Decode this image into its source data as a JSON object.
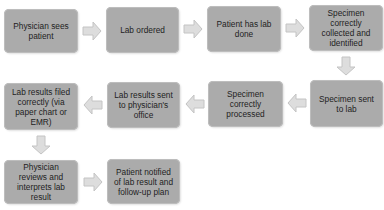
{
  "diagram": {
    "type": "flowchart",
    "title": "",
    "colors": {
      "box_fill": "#ababab",
      "arrow_fill": "#dddddd",
      "arrow_stroke": "#c4c4c4",
      "text": "#1e1e1e"
    },
    "steps": [
      {
        "id": 1,
        "label": "Physician sees patient"
      },
      {
        "id": 2,
        "label": "Lab ordered"
      },
      {
        "id": 3,
        "label": "Patient has lab done"
      },
      {
        "id": 4,
        "label": "Specimen correctly collected and identified"
      },
      {
        "id": 5,
        "label": "Specimen sent to lab"
      },
      {
        "id": 6,
        "label": "Specimen correctly processed"
      },
      {
        "id": 7,
        "label": "Lab results sent to physician's office"
      },
      {
        "id": 8,
        "label": "Lab results filed correctly (via paper chart or EMR)"
      },
      {
        "id": 9,
        "label": "Physician reviews and interprets lab result"
      },
      {
        "id": 10,
        "label": "Patient notified of lab result and follow-up plan"
      }
    ],
    "edges": [
      {
        "from": 1,
        "to": 2,
        "direction": "right"
      },
      {
        "from": 2,
        "to": 3,
        "direction": "right"
      },
      {
        "from": 3,
        "to": 4,
        "direction": "right"
      },
      {
        "from": 4,
        "to": 5,
        "direction": "down"
      },
      {
        "from": 5,
        "to": 6,
        "direction": "left"
      },
      {
        "from": 6,
        "to": 7,
        "direction": "left"
      },
      {
        "from": 7,
        "to": 8,
        "direction": "left"
      },
      {
        "from": 8,
        "to": 9,
        "direction": "down"
      },
      {
        "from": 9,
        "to": 10,
        "direction": "right"
      }
    ]
  }
}
